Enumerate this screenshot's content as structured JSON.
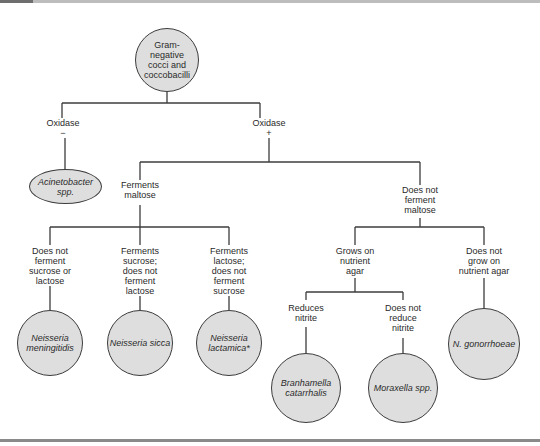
{
  "root": {
    "label": "Gram-\nnegative\ncocci and\ncoccobacilli"
  },
  "branches": {
    "oxidase_neg": {
      "label": "Oxidase\n−"
    },
    "oxidase_pos": {
      "label": "Oxidase\n+"
    },
    "ferments_maltose": {
      "label": "Ferments\nmaltose"
    },
    "no_maltose": {
      "label": "Does not\nferment\nmaltose"
    },
    "no_sucrose_lactose": {
      "label": "Does not\nferment\nsucrose or\nlactose"
    },
    "sucrose_no_lactose": {
      "label": "Ferments\nsucrose;\ndoes not\nferment\nlactose"
    },
    "lactose_no_sucrose": {
      "label": "Ferments\nlactose;\ndoes not\nferment\nsucrose"
    },
    "grows_nutrient": {
      "label": "Grows on\nnutrient\nagar"
    },
    "no_grow_nutrient": {
      "label": "Does not\ngrow on\nnutrient agar"
    },
    "reduces_nitrite": {
      "label": "Reduces\nnitrite"
    },
    "no_reduce_nitrite": {
      "label": "Does not\nreduce\nnitrite"
    }
  },
  "organisms": {
    "acinetobacter": {
      "label": "Acinetobacter\nspp."
    },
    "meningitidis": {
      "label": "Neisseria\nmeningitidis"
    },
    "sicca": {
      "label": "Neisseria sicca"
    },
    "lactamica": {
      "label": "Neisseria\nlactamica*"
    },
    "branhamella": {
      "label": "Branhamella\ncatarrhalis"
    },
    "moraxella": {
      "label": "Moraxella spp."
    },
    "gonorrhoeae": {
      "label": "N. gonorrhoeae"
    }
  },
  "colors": {
    "node_fill": "#dedede",
    "line": "#3c3c3c"
  }
}
